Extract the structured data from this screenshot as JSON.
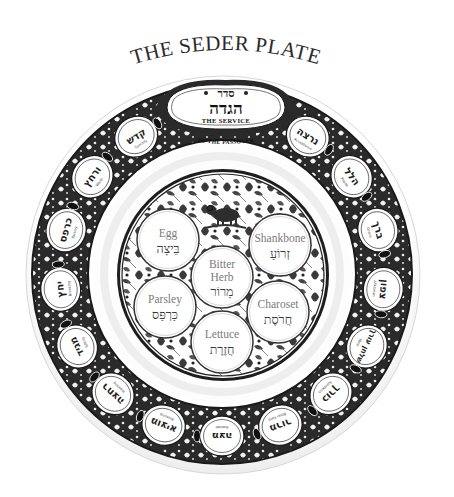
{
  "title": "THE SEDER PLATE",
  "colors": {
    "ink": "#1c1c1c",
    "band": "#2a2a2a",
    "plate": "#ffffff",
    "rim_shadow": "#e6e6e6",
    "english_label": "#7a7a7a",
    "hebrew_label": "#3a3a3a"
  },
  "title_cartouche": {
    "hebrew_top": "סדר",
    "hebrew_main": "הגדה",
    "english_main": "THE SERVICE",
    "english_sub": "OF THE PASSOVER"
  },
  "rim_steps": [
    {
      "hebrew": "נרצה",
      "english": "Acceptance"
    },
    {
      "hebrew": "הלל",
      "english": "Praise"
    },
    {
      "hebrew": "ברך",
      "english": "Grace"
    },
    {
      "hebrew": "צפון",
      "english": "Afikoman"
    },
    {
      "hebrew": "שלחן עורך",
      "english": "Meal"
    },
    {
      "hebrew": "כורך",
      "english": "Sandwich"
    },
    {
      "hebrew": "מרור",
      "english": "Bitter herb"
    },
    {
      "hebrew": "מצה",
      "english": "Matzah"
    },
    {
      "hebrew": "מוציא",
      "english": "Blessing"
    },
    {
      "hebrew": "רחצה",
      "english": "Washing"
    },
    {
      "hebrew": "מגיד",
      "english": "Telling"
    },
    {
      "hebrew": "יחץ",
      "english": "Breaking"
    },
    {
      "hebrew": "כרפס",
      "english": "Parsley"
    },
    {
      "hebrew": "ורחץ",
      "english": "Wash"
    },
    {
      "hebrew": "קדש",
      "english": "Sanctify"
    }
  ],
  "plate_items": [
    {
      "id": "egg",
      "english": "Egg",
      "hebrew": "בֵּיצָה"
    },
    {
      "id": "shankbone",
      "english": "Shankbone",
      "hebrew": "זְרוֹעַ"
    },
    {
      "id": "bitter-herb",
      "english_line1": "Bitter",
      "english_line2": "Herb",
      "hebrew": "מָרוֹר"
    },
    {
      "id": "parsley",
      "english": "Parsley",
      "hebrew": "כַּרְפַּס"
    },
    {
      "id": "charoset",
      "english": "Charoset",
      "hebrew": "חֲרֹסֶת"
    },
    {
      "id": "lettuce",
      "english": "Lettuce",
      "hebrew": "חֲזֶרֶת"
    }
  ]
}
